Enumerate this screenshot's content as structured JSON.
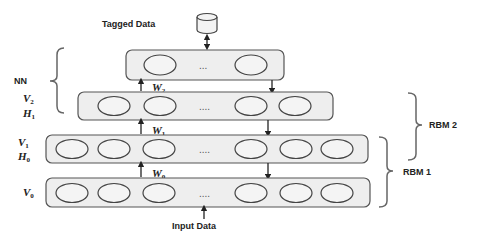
{
  "diagram": {
    "top": {
      "tagged_data_label": "Tagged Data",
      "storage_icon": "database-cylinder-icon"
    },
    "layers": [
      {
        "id": "output",
        "labels": [],
        "ellipsis": "...",
        "units_left": 1,
        "units_right": 1
      },
      {
        "id": "v2h1",
        "labels": [
          "V",
          "2",
          "H",
          "1"
        ],
        "ellipsis": "....",
        "units_left": 3,
        "units_right": 2
      },
      {
        "id": "v1h0",
        "labels": [
          "V",
          "1",
          "H",
          "0"
        ],
        "ellipsis": "....",
        "units_left": 3,
        "units_right": 3
      },
      {
        "id": "v0",
        "labels": [
          "V",
          "0"
        ],
        "ellipsis": "....",
        "units_left": 3,
        "units_right": 3
      }
    ],
    "weights": {
      "w2": {
        "base": "W",
        "sub": "2"
      },
      "w1": {
        "base": "W",
        "sub": "1"
      },
      "w0": {
        "base": "W",
        "sub": "0"
      }
    },
    "groups": {
      "nn": "NN",
      "rbm2": "RBM 2",
      "rbm1": "RBM 1"
    },
    "input_label": "Input Data",
    "colors": {
      "layer_fill": "#eeeeee",
      "stroke": "#555555",
      "text": "#222222"
    }
  }
}
